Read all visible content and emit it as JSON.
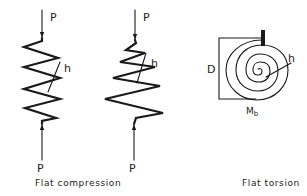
{
  "figure": {
    "panels": [
      {
        "id": "compression-cylindrical",
        "load_top_label": "P",
        "load_bottom_label": "P",
        "thickness_label": "h"
      },
      {
        "id": "compression-conical",
        "load_top_label": "P",
        "load_bottom_label": "P",
        "thickness_label": "h"
      },
      {
        "id": "torsion-spiral",
        "diameter_label": "D",
        "thickness_label": "h",
        "moment_label_main": "M",
        "moment_label_sub": "b"
      }
    ],
    "captions": {
      "compression": "Flat compression",
      "torsion": "Flat torsion"
    },
    "colors": {
      "ink": "#1a1a1a",
      "background": "#ffffff"
    }
  }
}
